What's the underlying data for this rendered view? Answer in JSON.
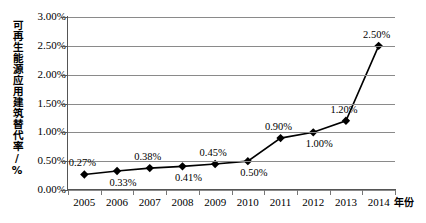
{
  "chart_data": {
    "type": "line",
    "title": "",
    "xlabel": "年份",
    "ylabel": "可再生能源应用建筑替代率/%",
    "categories": [
      "2005",
      "2006",
      "2007",
      "2008",
      "2009",
      "2010",
      "2011",
      "2012",
      "2013",
      "2014"
    ],
    "values": [
      0.27,
      0.33,
      0.38,
      0.41,
      0.45,
      0.5,
      0.9,
      1.0,
      1.2,
      2.5
    ],
    "point_labels": [
      "0.27%",
      "0.33%",
      "0.38%",
      "0.41%",
      "0.45%",
      "0.50%",
      "0.90%",
      "1.00%",
      "1.20%",
      "2.50%"
    ],
    "label_positions": [
      "above",
      "below",
      "above",
      "below",
      "above",
      "below",
      "above",
      "below",
      "above",
      "above"
    ],
    "ylim": [
      0,
      3.0
    ],
    "ytick_values": [
      0,
      0.5,
      1.0,
      1.5,
      2.0,
      2.5,
      3.0
    ],
    "ytick_labels": [
      "0.00%",
      "0.50%",
      "1.00%",
      "1.50%",
      "2.00%",
      "2.50%",
      "3.00%"
    ],
    "grid": true,
    "legend": "none",
    "series_color": "#000000",
    "grid_color": "#8a8a8a",
    "marker": "diamond"
  }
}
